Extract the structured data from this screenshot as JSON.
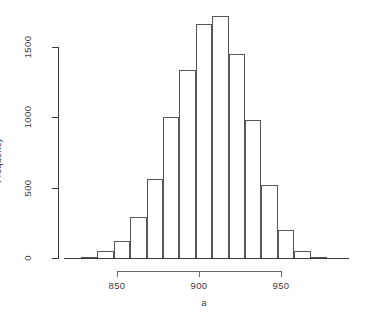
{
  "chart_data": {
    "type": "bar",
    "title": "",
    "subtitle": "",
    "xlabel": "a",
    "ylabel": "Frequency",
    "grid": false,
    "legend": "none",
    "xlim": [
      828,
      998
    ],
    "ylim": [
      0,
      1800
    ],
    "bin_width": 10,
    "x_ticks": [
      850,
      900,
      950
    ],
    "x_tick_labels": [
      "850",
      "900",
      "950"
    ],
    "y_ticks": [
      0,
      500,
      1000,
      1500
    ],
    "y_tick_labels": [
      "0",
      "500",
      "1000",
      "1500"
    ],
    "bin_starts": [
      828,
      838,
      848,
      858,
      868,
      878,
      888,
      898,
      908,
      918,
      928,
      938,
      948,
      958,
      968
    ],
    "categories": [
      "828-838",
      "838-848",
      "848-858",
      "858-868",
      "868-878",
      "878-888",
      "888-898",
      "898-908",
      "908-918",
      "918-928",
      "928-938",
      "938-948",
      "948-958",
      "958-968",
      "968-978"
    ],
    "values": [
      10,
      50,
      120,
      290,
      560,
      1000,
      1340,
      1660,
      1720,
      1450,
      980,
      520,
      200,
      50,
      10
    ]
  },
  "axes": {
    "y_title": "Frequency",
    "x_title": "a",
    "y_tick_labels": [
      "1500",
      "1000",
      "500",
      "0"
    ],
    "x_tick_labels": [
      "850",
      "900",
      "950"
    ]
  },
  "colors": {
    "background": "#ffffff",
    "axis": "#3a3a3a",
    "bar_outline": "#565656",
    "bar_fill": "#ffffff",
    "text": "#3c3c3c"
  }
}
